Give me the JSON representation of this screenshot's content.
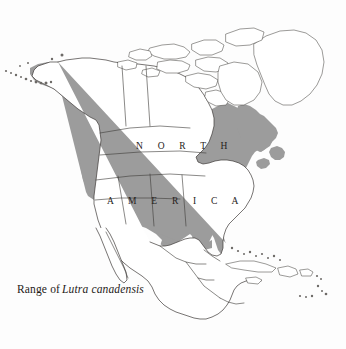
{
  "figure": {
    "type": "range-map",
    "background_color": "#fdfdfd",
    "range_fill_color": "#9c9c9c",
    "outline_color": "#3d3a38",
    "text_color": "#1d1a18",
    "width": 346,
    "height": 349
  },
  "caption": {
    "prefix": "Range of",
    "species": "Lutra canadensis",
    "full_text": "Range of Lutra canadensis"
  },
  "map_labels": {
    "continent_line_1": "N O R T H",
    "continent_line_2": "A M E R I C A"
  },
  "legend": {
    "shaded_meaning": "Range of Lutra canadensis",
    "unshaded_meaning": "Outside range"
  },
  "regions": {
    "shaded": [
      "Alaska",
      "Yukon",
      "British Columbia",
      "Alberta",
      "Saskatchewan",
      "Manitoba",
      "Ontario",
      "Quebec",
      "Labrador",
      "Newfoundland",
      "Nova Scotia",
      "New Brunswick",
      "Pacific Northwest",
      "Great Plains",
      "Midwest",
      "Great Lakes States",
      "New England",
      "Appalachians",
      "Southeast United States",
      "Florida",
      "Gulf Coast"
    ],
    "unshaded": [
      "Greenland",
      "Canadian Arctic Archipelago",
      "Hudson Bay",
      "Baffin Island",
      "Ellesmere Island",
      "Victoria Island",
      "Banks Island",
      "Southwest desert United States",
      "Great Basin",
      "Baja California",
      "Mexico",
      "Central America",
      "Caribbean Islands",
      "Cuba",
      "Hispaniola",
      "Puerto Rico",
      "Bahamas"
    ]
  }
}
